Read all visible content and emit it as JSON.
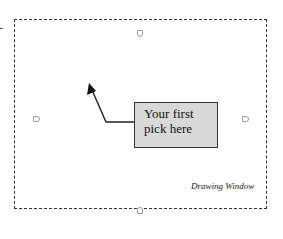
{
  "diagram": {
    "callout": {
      "line1": "Your first",
      "line2": "pick here",
      "fill": "#d9d9d9",
      "border": "#333333"
    },
    "caption": "Drawing Window",
    "frame": {
      "style": "dashed",
      "color": "#333333"
    },
    "handles": [
      "top",
      "left",
      "right",
      "bottom"
    ],
    "arrow": {
      "description": "Arrow from the callout box pointing up-left into the drawing window"
    }
  }
}
